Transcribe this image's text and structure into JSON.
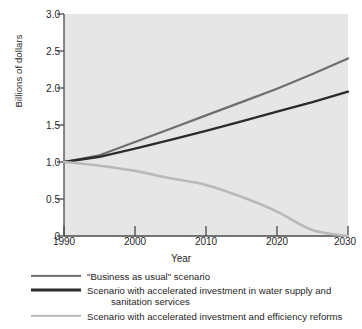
{
  "chart_data": {
    "type": "line",
    "title": "",
    "xlabel": "Year",
    "ylabel": "Billions of dollars",
    "xlim": [
      1990,
      2030
    ],
    "ylim": [
      0,
      3.0
    ],
    "grid": false,
    "legend_position": "below",
    "x_ticks": [
      "1990",
      "2000",
      "2010",
      "2020",
      "2030"
    ],
    "x_tick_values": [
      1990,
      2000,
      2010,
      2020,
      2030
    ],
    "y_ticks": [
      "0",
      "0.5",
      "1.0",
      "1.5",
      "2.0",
      "2.5",
      "3.0"
    ],
    "y_tick_values": [
      0,
      0.5,
      1.0,
      1.5,
      2.0,
      2.5,
      3.0
    ],
    "x": [
      1990,
      1995,
      2000,
      2005,
      2010,
      2015,
      2020,
      2025,
      2030
    ],
    "series": [
      {
        "name": "\"Business as usual\" scenario",
        "color": "#6e6e6e",
        "values": [
          1.0,
          1.09,
          1.27,
          1.45,
          1.63,
          1.81,
          1.99,
          2.19,
          2.4
        ]
      },
      {
        "name": "Scenario with accelerated investment in water supply and sanitation services",
        "color": "#2b2b2b",
        "values": [
          1.0,
          1.07,
          1.18,
          1.3,
          1.42,
          1.55,
          1.68,
          1.81,
          1.95
        ]
      },
      {
        "name": "Scenario with accelerated investment and efficiency reforms",
        "color": "#b9b9b9",
        "values": [
          1.0,
          0.95,
          0.88,
          0.78,
          0.69,
          0.53,
          0.33,
          0.08,
          0.0
        ]
      }
    ]
  },
  "legend": {
    "items": [
      {
        "label": "\"Business as usual\" scenario",
        "line1": "\"Business as usual\" scenario",
        "line2": ""
      },
      {
        "label": "Scenario with accelerated investment in water supply and sanitation services",
        "line1": "Scenario with accelerated investment in water supply and",
        "line2": "sanitation services"
      },
      {
        "label": "Scenario with accelerated investment and efficiency reforms",
        "line1": "Scenario with accelerated investment and efficiency reforms",
        "line2": ""
      }
    ]
  },
  "colors": {
    "plot_background": "#e6e6e6",
    "axis": "#4a4a4a",
    "text": "#1f1f1f",
    "series_business_as_usual": "#6e6e6e",
    "series_accelerated_investment": "#2b2b2b",
    "series_efficiency_reforms": "#b9b9b9"
  }
}
